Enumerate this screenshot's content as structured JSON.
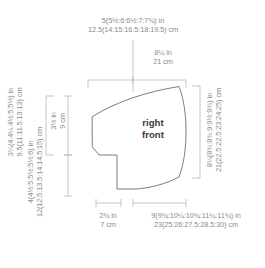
{
  "diagram": {
    "title": "right front",
    "piece_label_line1": "right",
    "piece_label_line2": "front",
    "line_color": "#6e6e6e",
    "dim_line_color": "#b8b8b8",
    "text_color": "#8c8c8c",
    "piece_text_color": "#3b3b3b",
    "background": "#ffffff"
  },
  "measurements": {
    "top_width": {
      "inches": "5(5½:6:6½:7:7¾) in",
      "cm": "12.5(14:15:16.5:18:19.5) cm"
    },
    "top_right_segment": {
      "inches": "8¼ in",
      "cm": "21 cm"
    },
    "right_side": {
      "inches": "8¼(8¾:8¾:9:9½:9¾) in",
      "cm": "21(22.5:22.5:23:24:25) cm"
    },
    "left_upper_outer": {
      "inches": "3¼(4:4¼:4½:5:5½) in",
      "cm": "9.5(11:11.5:13:13) cm"
    },
    "left_upper_inner": {
      "inches": "3½ in",
      "cm": "9 cm"
    },
    "left_lower": {
      "inches": "4(4½:5:5½:5½:6) in",
      "cm": "12(12.5:13.5:14:14.5:15) cm"
    },
    "bottom_left_segment": {
      "inches": "2¾ in",
      "cm": "7 cm"
    },
    "bottom_width": {
      "inches": "9(9¾:10¼:10¾:11¼:11¾) in",
      "cm": "23(25:26:27.5:28.5:30) cm"
    }
  }
}
